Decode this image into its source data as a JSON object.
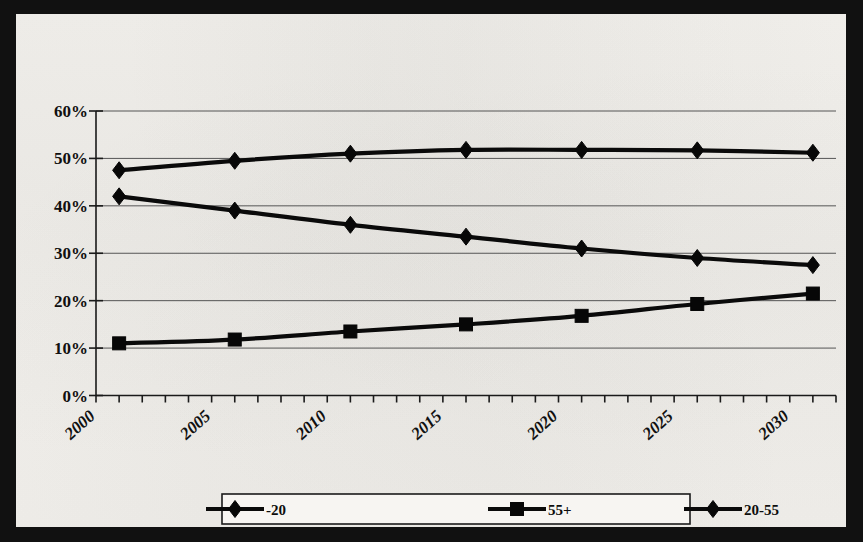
{
  "chart_data": {
    "type": "line",
    "title": "",
    "subtitle": "",
    "xlabel": "",
    "ylabel": "",
    "xlim": [
      2000,
      2032
    ],
    "ylim": [
      0,
      60
    ],
    "ytick_values": [
      0,
      10,
      20,
      30,
      40,
      50,
      60
    ],
    "ytick_labels": [
      "0%",
      "10%",
      "20%",
      "30%",
      "40%",
      "50%",
      "60%"
    ],
    "xtick_values": [
      2000,
      2005,
      2010,
      2015,
      2020,
      2025,
      2030
    ],
    "xtick_labels": [
      "2000",
      "2005",
      "2010",
      "2015",
      "2020",
      "2025",
      "2030"
    ],
    "x_minor_tick_interval": 1,
    "grid": "horizontal",
    "legend_position": "bottom",
    "x": [
      2001,
      2006,
      2011,
      2016,
      2021,
      2026,
      2031
    ],
    "series": [
      {
        "name": "-20",
        "marker": "diamond",
        "values": [
          42.0,
          39.0,
          36.0,
          33.5,
          31.0,
          29.0,
          27.5
        ]
      },
      {
        "name": "55+",
        "marker": "square",
        "values": [
          11.0,
          11.8,
          13.5,
          15.0,
          16.8,
          19.3,
          21.5
        ]
      },
      {
        "name": "20-55",
        "marker": "diamond",
        "values": [
          47.5,
          49.5,
          51.0,
          51.8,
          51.8,
          51.7,
          51.2
        ]
      }
    ],
    "colors": {
      "series_line": "#0a0a0a",
      "marker": "#070707",
      "gridline": "#555555",
      "axis": "#1a1a1a",
      "plot_background": "#f3f1ed",
      "page_border": "#111111"
    }
  },
  "legend": {
    "entries": [
      {
        "label": "-20",
        "marker": "diamond"
      },
      {
        "label": "55+",
        "marker": "square"
      },
      {
        "label": "20-55",
        "marker": "diamond"
      }
    ]
  }
}
